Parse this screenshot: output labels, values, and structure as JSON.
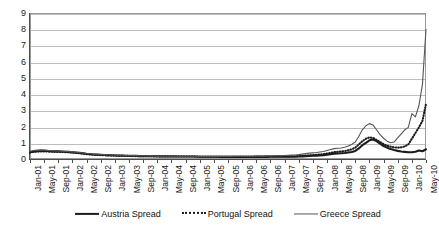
{
  "chart_data": {
    "type": "line",
    "title": "",
    "subtitle": "",
    "xlabel": "",
    "ylabel": "",
    "ylim": [
      0,
      9
    ],
    "y_ticks": [
      0,
      1,
      2,
      3,
      4,
      5,
      6,
      7,
      8,
      9
    ],
    "grid": true,
    "legend_position": "bottom",
    "x_tick_labels": [
      "Jan-01",
      "May-01",
      "Sep-01",
      "Jan-02",
      "May-02",
      "Sep-02",
      "Jan-03",
      "May-03",
      "Sep-03",
      "Jan-04",
      "May-04",
      "Sep-04",
      "Jan-05",
      "May-05",
      "Sep-05",
      "Jan-06",
      "May-06",
      "Sep-06",
      "Jan-07",
      "May-07",
      "Sep-07",
      "Jan-08",
      "May-08",
      "Sep-08",
      "Jan-09",
      "May-09",
      "Sep-09",
      "Jan-10",
      "May-10"
    ],
    "x": [
      "Jan-01",
      "Feb-01",
      "Mar-01",
      "Apr-01",
      "May-01",
      "Jun-01",
      "Jul-01",
      "Aug-01",
      "Sep-01",
      "Oct-01",
      "Nov-01",
      "Dec-01",
      "Jan-02",
      "Feb-02",
      "Mar-02",
      "Apr-02",
      "May-02",
      "Jun-02",
      "Jul-02",
      "Aug-02",
      "Sep-02",
      "Oct-02",
      "Nov-02",
      "Dec-02",
      "Jan-03",
      "Feb-03",
      "Mar-03",
      "Apr-03",
      "May-03",
      "Jun-03",
      "Jul-03",
      "Aug-03",
      "Sep-03",
      "Oct-03",
      "Nov-03",
      "Dec-03",
      "Jan-04",
      "Feb-04",
      "Mar-04",
      "Apr-04",
      "May-04",
      "Jun-04",
      "Jul-04",
      "Aug-04",
      "Sep-04",
      "Oct-04",
      "Nov-04",
      "Dec-04",
      "Jan-05",
      "Feb-05",
      "Mar-05",
      "Apr-05",
      "May-05",
      "Jun-05",
      "Jul-05",
      "Aug-05",
      "Sep-05",
      "Oct-05",
      "Nov-05",
      "Dec-05",
      "Jan-06",
      "Feb-06",
      "Mar-06",
      "Apr-06",
      "May-06",
      "Jun-06",
      "Jul-06",
      "Aug-06",
      "Sep-06",
      "Oct-06",
      "Nov-06",
      "Dec-06",
      "Jan-07",
      "Feb-07",
      "Mar-07",
      "Apr-07",
      "May-07",
      "Jun-07",
      "Jul-07",
      "Aug-07",
      "Sep-07",
      "Oct-07",
      "Nov-07",
      "Dec-07",
      "Jan-08",
      "Feb-08",
      "Mar-08",
      "Apr-08",
      "May-08",
      "Jun-08",
      "Jul-08",
      "Aug-08",
      "Sep-08",
      "Oct-08",
      "Nov-08",
      "Dec-08",
      "Jan-09",
      "Feb-09",
      "Mar-09",
      "Apr-09",
      "May-09",
      "Jun-09",
      "Jul-09",
      "Aug-09",
      "Sep-09",
      "Oct-09",
      "Nov-09",
      "Dec-09",
      "Jan-10",
      "Feb-10",
      "Mar-10",
      "Apr-10",
      "May-10"
    ],
    "series": [
      {
        "name": "Austria Spread",
        "style": "solid-thick",
        "color": "#1c1c1c",
        "values": [
          0.42,
          0.46,
          0.48,
          0.5,
          0.5,
          0.49,
          0.48,
          0.47,
          0.47,
          0.46,
          0.45,
          0.44,
          0.42,
          0.4,
          0.38,
          0.35,
          0.32,
          0.3,
          0.28,
          0.27,
          0.26,
          0.25,
          0.24,
          0.23,
          0.22,
          0.21,
          0.21,
          0.2,
          0.2,
          0.19,
          0.19,
          0.18,
          0.18,
          0.18,
          0.17,
          0.17,
          0.17,
          0.16,
          0.16,
          0.16,
          0.16,
          0.16,
          0.15,
          0.15,
          0.15,
          0.15,
          0.15,
          0.15,
          0.14,
          0.14,
          0.14,
          0.14,
          0.14,
          0.14,
          0.13,
          0.13,
          0.13,
          0.13,
          0.13,
          0.13,
          0.13,
          0.13,
          0.13,
          0.13,
          0.13,
          0.13,
          0.13,
          0.13,
          0.14,
          0.14,
          0.14,
          0.14,
          0.14,
          0.14,
          0.14,
          0.14,
          0.15,
          0.16,
          0.18,
          0.19,
          0.2,
          0.21,
          0.22,
          0.24,
          0.27,
          0.3,
          0.33,
          0.34,
          0.35,
          0.37,
          0.4,
          0.43,
          0.5,
          0.65,
          0.85,
          1.0,
          1.15,
          1.2,
          1.1,
          0.95,
          0.8,
          0.7,
          0.62,
          0.55,
          0.5,
          0.46,
          0.44,
          0.42,
          0.42,
          0.45,
          0.52,
          0.48,
          0.6
        ]
      },
      {
        "name": "Portugal Spread",
        "style": "dotted",
        "color": "#1c1c1c",
        "values": [
          0.4,
          0.44,
          0.46,
          0.47,
          0.47,
          0.46,
          0.45,
          0.44,
          0.44,
          0.43,
          0.42,
          0.41,
          0.39,
          0.37,
          0.35,
          0.32,
          0.3,
          0.28,
          0.26,
          0.25,
          0.24,
          0.23,
          0.22,
          0.21,
          0.21,
          0.2,
          0.2,
          0.19,
          0.19,
          0.18,
          0.18,
          0.18,
          0.17,
          0.17,
          0.17,
          0.16,
          0.16,
          0.16,
          0.16,
          0.16,
          0.15,
          0.15,
          0.15,
          0.15,
          0.15,
          0.15,
          0.15,
          0.14,
          0.14,
          0.14,
          0.14,
          0.14,
          0.14,
          0.14,
          0.14,
          0.14,
          0.14,
          0.14,
          0.14,
          0.14,
          0.14,
          0.14,
          0.14,
          0.14,
          0.15,
          0.15,
          0.15,
          0.15,
          0.15,
          0.16,
          0.16,
          0.16,
          0.16,
          0.16,
          0.17,
          0.17,
          0.18,
          0.19,
          0.21,
          0.22,
          0.24,
          0.26,
          0.28,
          0.3,
          0.34,
          0.38,
          0.42,
          0.44,
          0.46,
          0.49,
          0.54,
          0.6,
          0.7,
          0.9,
          1.1,
          1.25,
          1.33,
          1.3,
          1.18,
          1.05,
          0.92,
          0.82,
          0.76,
          0.72,
          0.7,
          0.72,
          0.78,
          0.9,
          1.25,
          1.6,
          1.95,
          2.35,
          3.4
        ]
      },
      {
        "name": "Greece Spread",
        "style": "solid-thin",
        "color": "#555555",
        "values": [
          0.48,
          0.52,
          0.55,
          0.56,
          0.55,
          0.53,
          0.51,
          0.5,
          0.49,
          0.48,
          0.47,
          0.46,
          0.44,
          0.42,
          0.4,
          0.37,
          0.34,
          0.32,
          0.3,
          0.29,
          0.28,
          0.27,
          0.26,
          0.25,
          0.24,
          0.23,
          0.23,
          0.22,
          0.22,
          0.21,
          0.21,
          0.2,
          0.2,
          0.19,
          0.19,
          0.19,
          0.18,
          0.18,
          0.18,
          0.18,
          0.18,
          0.18,
          0.17,
          0.17,
          0.17,
          0.17,
          0.17,
          0.17,
          0.16,
          0.16,
          0.16,
          0.16,
          0.16,
          0.16,
          0.16,
          0.16,
          0.16,
          0.16,
          0.17,
          0.17,
          0.17,
          0.17,
          0.17,
          0.17,
          0.18,
          0.18,
          0.18,
          0.19,
          0.19,
          0.2,
          0.2,
          0.21,
          0.22,
          0.23,
          0.24,
          0.25,
          0.27,
          0.3,
          0.33,
          0.36,
          0.38,
          0.4,
          0.43,
          0.46,
          0.52,
          0.58,
          0.64,
          0.66,
          0.68,
          0.72,
          0.8,
          0.9,
          1.05,
          1.4,
          1.8,
          2.05,
          2.18,
          2.1,
          1.8,
          1.5,
          1.28,
          1.1,
          1.0,
          1.05,
          1.3,
          1.55,
          1.8,
          1.95,
          2.8,
          2.6,
          3.3,
          4.6,
          8.0
        ]
      }
    ]
  },
  "legend": {
    "entries": [
      {
        "label": "Austria Spread",
        "swatch": "solid-thick-line-icon"
      },
      {
        "label": "Portugal Spread",
        "swatch": "dotted-line-icon"
      },
      {
        "label": "Greece Spread",
        "swatch": "solid-thin-line-icon"
      }
    ]
  }
}
